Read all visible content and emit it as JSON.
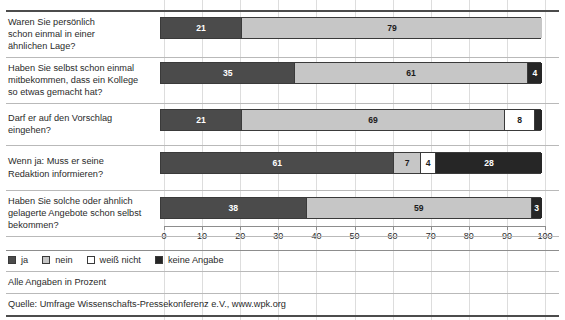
{
  "chart_data": {
    "type": "bar",
    "orientation": "horizontal",
    "stacked": true,
    "title": "",
    "subtitle": "",
    "xlabel": "",
    "ylabel": "",
    "xlim": [
      0,
      100
    ],
    "xticks": [
      0,
      10,
      20,
      30,
      40,
      50,
      60,
      70,
      80,
      90,
      100
    ],
    "grid": true,
    "grid_axis": "x",
    "legend_position": "bottom-left",
    "units": "percent",
    "legend": [
      "ja",
      "nein",
      "weiß nicht",
      "keine Angabe"
    ],
    "series": [
      {
        "name": "ja",
        "values": [
          21,
          35,
          21,
          61,
          38
        ]
      },
      {
        "name": "nein",
        "values": [
          79,
          61,
          69,
          7,
          59
        ]
      },
      {
        "name": "weiß nicht",
        "values": [
          0,
          0,
          8,
          4,
          0
        ]
      },
      {
        "name": "keine Angabe",
        "values": [
          0,
          4,
          2,
          28,
          3
        ]
      }
    ],
    "categories": [
      "Waren Sie persönlich schon einmal in einer ähnlichen Lage?",
      "Haben Sie selbst schon einmal mitbekommen, dass ein Kollege so etwas gemacht hat?",
      "Darf er auf den Vorschlag eingehen?",
      "Wenn ja: Muss er seine Redaktion informieren?",
      "Haben Sie solche oder ähnlich gelagerte Angebote schon selbst bekommen?"
    ],
    "rows": [
      {
        "label_lines": [
          "Waren Sie persönlich",
          "schon einmal in einer",
          "ähnlichen Lage?"
        ],
        "segments": [
          {
            "series": "ja",
            "value": 21,
            "label": "21"
          },
          {
            "series": "nein",
            "value": 79,
            "label": "79"
          }
        ]
      },
      {
        "label_lines": [
          "Haben Sie selbst schon einmal",
          "mitbekommen, dass ein Kollege",
          "so etwas gemacht hat?"
        ],
        "segments": [
          {
            "series": "ja",
            "value": 35,
            "label": "35"
          },
          {
            "series": "nein",
            "value": 61,
            "label": "61"
          },
          {
            "series": "keine Angabe",
            "value": 4,
            "label": "4"
          }
        ]
      },
      {
        "label_lines": [
          "Darf er auf den Vorschlag eingehen?"
        ],
        "segments": [
          {
            "series": "ja",
            "value": 21,
            "label": "21"
          },
          {
            "series": "nein",
            "value": 69,
            "label": "69"
          },
          {
            "series": "weiß nicht",
            "value": 8,
            "label": "8"
          },
          {
            "series": "keine Angabe",
            "value": 2,
            "label": ""
          }
        ]
      },
      {
        "label_lines": [
          "Wenn ja: Muss er seine",
          "Redaktion informieren?"
        ],
        "segments": [
          {
            "series": "ja",
            "value": 61,
            "label": "61"
          },
          {
            "series": "nein",
            "value": 7,
            "label": "7"
          },
          {
            "series": "weiß nicht",
            "value": 4,
            "label": "4"
          },
          {
            "series": "keine Angabe",
            "value": 28,
            "label": "28"
          }
        ]
      },
      {
        "label_lines": [
          "Haben Sie solche oder ähnlich",
          "gelagerte Angebote schon selbst",
          "bekommen?"
        ],
        "segments": [
          {
            "series": "ja",
            "value": 38,
            "label": "38"
          },
          {
            "series": "nein",
            "value": 59,
            "label": "59"
          },
          {
            "series": "keine Angabe",
            "value": 3,
            "label": "3"
          }
        ]
      }
    ]
  },
  "axis": {
    "tick_labels": [
      "0",
      "10",
      "20",
      "30",
      "40",
      "50",
      "60",
      "70",
      "80",
      "90",
      "100"
    ]
  },
  "legend": {
    "items": [
      {
        "label": "ja",
        "swatch": "ja",
        "color": "#4b4b4b"
      },
      {
        "label": "nein",
        "swatch": "nein",
        "color": "#c6c6c6"
      },
      {
        "label": "weiß nicht",
        "swatch": "weiss",
        "color": "#ffffff"
      },
      {
        "label": "keine Angabe",
        "swatch": "keine",
        "color": "#262626"
      }
    ]
  },
  "footer": {
    "note": "Alle Angaben in Prozent",
    "source": "Quelle: Umfrage Wissenschafts-Pressekonferenz e.V., www.wpk.org"
  },
  "colors": {
    "ja": "#4b4b4b",
    "nein": "#c6c6c6",
    "weiss_nicht": "#ffffff",
    "keine_angabe": "#262626",
    "rule": "#8d8d8d",
    "grid": "#dddddd",
    "text": "#2a2a2a"
  }
}
